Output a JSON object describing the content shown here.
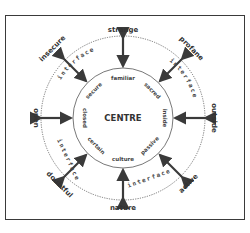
{
  "diagram": {
    "centre_label": "CENTRE",
    "outer_labels": {
      "top": "strange",
      "top_right": "profane",
      "right": "outside",
      "bottom_right": "active",
      "bottom": "nature",
      "bottom_left": "doubtful",
      "left": "open",
      "top_left": "insecure"
    },
    "inner_labels": {
      "top": "familiar",
      "top_right": "sacred",
      "right": "inside",
      "bottom_right": "passive",
      "bottom": "culture",
      "bottom_left": "certain",
      "left": "closed",
      "top_left": "secure"
    },
    "interface_label": "interface",
    "colors": {
      "stroke": "#3a3a3a",
      "text": "#333333",
      "background": "#ffffff"
    }
  }
}
